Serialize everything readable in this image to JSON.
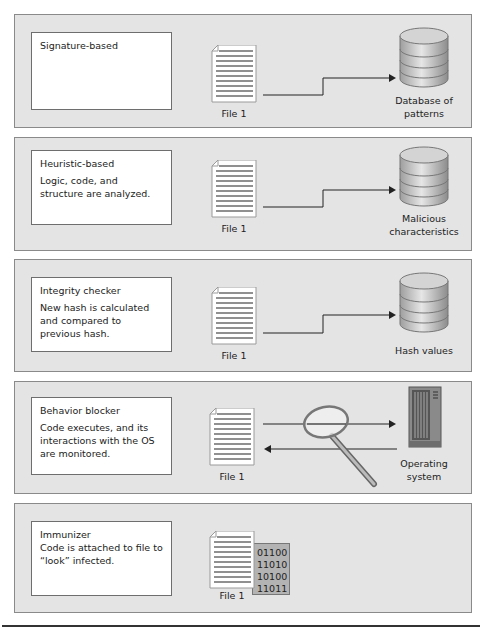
{
  "panels": [
    {
      "title": "Signature-based",
      "body": "",
      "file_label": "File 1",
      "target_label_line1": "Database of",
      "target_label_line2": "patterns",
      "target_icon": "database-icon"
    },
    {
      "title": "Heuristic-based",
      "body": "Logic, code, and structure are analyzed.",
      "file_label": "File 1",
      "target_label_line1": "Malicious",
      "target_label_line2": "characteristics",
      "target_icon": "database-icon"
    },
    {
      "title": "Integrity checker",
      "body": "New hash is calculated and compared to previous hash.",
      "file_label": "File 1",
      "target_label_line1": "Hash values",
      "target_label_line2": "",
      "target_icon": "database-icon"
    },
    {
      "title": "Behavior blocker",
      "body": "Code executes, and its interactions with the OS are monitored.",
      "file_label": "File 1",
      "target_label_line1": "Operating",
      "target_label_line2": "system",
      "target_icon": "server-tower-icon"
    },
    {
      "title": "Immunizer",
      "body": "Code is attached to file to “look” infected.",
      "file_label": "File 1",
      "binary_lines": [
        "01100",
        "11010",
        "10100",
        "11011"
      ]
    }
  ],
  "colors": {
    "panel_bg": "#e4e4e4",
    "panel_border": "#8a8a8a",
    "db_fill": "#c9c9c9",
    "binary_bg": "#b3b3b3"
  }
}
